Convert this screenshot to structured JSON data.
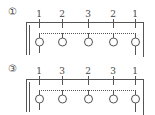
{
  "diagram": {
    "colors": {
      "line": "#555555",
      "background": "#ffffff"
    },
    "panels": [
      {
        "label": "①",
        "numbers": [
          "1",
          "2",
          "3",
          "2",
          "1"
        ],
        "positions_x": [
          39,
          62,
          88,
          113,
          135
        ]
      },
      {
        "label": "③",
        "numbers": [
          "1",
          "3",
          "2",
          "3",
          "1"
        ],
        "positions_x": [
          39,
          62,
          88,
          113,
          135
        ]
      }
    ]
  }
}
